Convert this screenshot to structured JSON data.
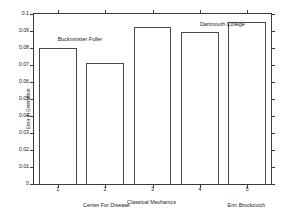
{
  "chart_data": {
    "type": "bar",
    "title": "",
    "xlabel": "",
    "ylabel": "Error in Estimation",
    "categories": [
      "1",
      "2",
      "3",
      "4",
      "5"
    ],
    "values": [
      0.08,
      0.0712,
      0.0925,
      0.0893,
      0.0955
    ],
    "ylim": [
      0,
      0.1
    ],
    "xlim": [
      0.5,
      5.5
    ],
    "ytick_labels": [
      "0",
      "0.01",
      "0.02",
      "0.03",
      "0.04",
      "0.05",
      "0.06",
      "0.07",
      "0.08",
      "0.09",
      "0.1"
    ],
    "ytick_values": [
      0,
      0.01,
      0.02,
      0.03,
      0.04,
      0.05,
      0.06,
      0.07,
      0.08,
      0.09,
      0.1
    ],
    "xtick_labels": [
      "1",
      "2",
      "3",
      "4",
      "5"
    ],
    "xtick_values": [
      1,
      2,
      3,
      4,
      5
    ],
    "grid": false,
    "legend": null,
    "bar_facecolor": "#ffffff",
    "bar_edgecolor": "#4a4a4a",
    "axis_color": "#3a3a3a",
    "annotations": [
      {
        "text": "Buckminster Fuller",
        "x": 1.0,
        "y": 0.0865,
        "placement": "in-plot"
      },
      {
        "text": "Dartmouth College",
        "x": 4.0,
        "y": 0.0955,
        "placement": "in-plot"
      },
      {
        "text": "Center For Disease",
        "x": 2.05,
        "y": -0.012,
        "placement": "below-axis"
      },
      {
        "text": "Classical Mechanics",
        "x": 3.0,
        "y": -0.01,
        "placement": "below-axis"
      },
      {
        "text": "Erin Brockovich",
        "x": 5.0,
        "y": -0.012,
        "placement": "below-axis"
      }
    ]
  }
}
